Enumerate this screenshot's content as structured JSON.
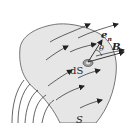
{
  "diagram": {
    "labels": {
      "normal": "e",
      "normal_sub": "n",
      "angle": "θ",
      "field": "B",
      "area_element": "dS",
      "surface": "S"
    },
    "colors": {
      "surface_fill": "#e6e6e6",
      "surface_stroke": "#555555",
      "line": "#222222",
      "patch_fill": "#9a9a9a"
    }
  }
}
